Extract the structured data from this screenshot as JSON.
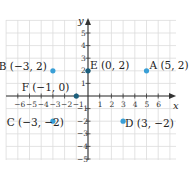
{
  "diagram": {
    "type": "coordinate-plane",
    "origin_px": [
      88,
      96
    ],
    "unit_px": [
      11.7,
      12.6
    ],
    "x_range": [
      -7,
      7
    ],
    "y_range": [
      -5,
      6
    ],
    "grid_extent_px": {
      "x0": 6,
      "x1": 176,
      "y0": 20,
      "y1": 160
    },
    "axes": {
      "x_label": "x",
      "y_label": "y",
      "x_ticks": [
        -6,
        -5,
        -4,
        -3,
        -2,
        -1,
        1,
        2,
        3,
        4,
        5,
        6
      ],
      "x_tick_labels": [
        "−6",
        "−5",
        "−4",
        "−3",
        "−2",
        "−1",
        "1",
        "2",
        "3",
        "4",
        "5",
        "6"
      ],
      "y_ticks": [
        5,
        4,
        3,
        2,
        1,
        -1,
        -2,
        -3,
        -4,
        -5
      ],
      "y_tick_labels": [
        "5",
        "4",
        "3",
        "2",
        "1",
        "−1",
        "−2",
        "−3",
        "−4",
        "−5"
      ]
    },
    "colors": {
      "grid": "#dcdcdc",
      "axis": "#333333",
      "point_light": "#3a9fd6",
      "point_dark": "#1b5f7d"
    },
    "points": [
      {
        "name": "A",
        "x": 5,
        "y": 2,
        "label": "A (5, 2)",
        "style": "light",
        "label_pos": "right"
      },
      {
        "name": "B",
        "x": -3,
        "y": 2,
        "label": "B (−3, 2)",
        "style": "light",
        "label_pos": "left"
      },
      {
        "name": "C",
        "x": -3,
        "y": -2,
        "label": "C (−3, −2)",
        "style": "light",
        "label_pos": "left"
      },
      {
        "name": "D",
        "x": 3,
        "y": -2,
        "label": "D (3, −2)",
        "style": "light",
        "label_pos": "right"
      },
      {
        "name": "E",
        "x": 0,
        "y": 2,
        "label": "E (0, 2)",
        "style": "dark",
        "label_pos": "right"
      },
      {
        "name": "F",
        "x": -1,
        "y": 0,
        "label": "F (−1, 0)",
        "style": "dark",
        "label_pos": "upper-left"
      }
    ]
  }
}
